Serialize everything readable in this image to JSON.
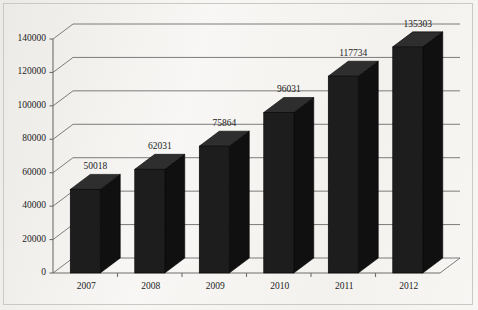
{
  "chart_data": {
    "type": "bar",
    "title": "",
    "subtitle": "",
    "xlabel": "",
    "ylabel": "",
    "categories": [
      "2007",
      "2008",
      "2009",
      "2010",
      "2011",
      "2012"
    ],
    "values": [
      50018,
      62031,
      75864,
      96031,
      117734,
      135303
    ],
    "series": [
      {
        "name": "",
        "values": [
          50018,
          62031,
          75864,
          96031,
          117734,
          135303
        ]
      }
    ],
    "data_labels": [
      "50018",
      "62031",
      "75864",
      "96031",
      "117734",
      "135303"
    ],
    "ylim": [
      0,
      140000
    ],
    "ytick_values": [
      0,
      20000,
      40000,
      60000,
      80000,
      100000,
      120000,
      140000
    ],
    "ytick_labels": [
      "0",
      "20000",
      "40000",
      "60000",
      "80000",
      "100000",
      "120000",
      "140000"
    ],
    "grid": true,
    "grid_axis": "y",
    "legend": false,
    "legend_position": "none",
    "three_d": true,
    "bar_color": "#1d1d1d",
    "bar_side_color": "#101010",
    "bar_top_color": "#2e2e2e",
    "axis_color": "#6e6e6e",
    "grid_color": "#6e6e6e",
    "background_color": "#f7f6f4",
    "text_color": "#1b1b1b"
  }
}
